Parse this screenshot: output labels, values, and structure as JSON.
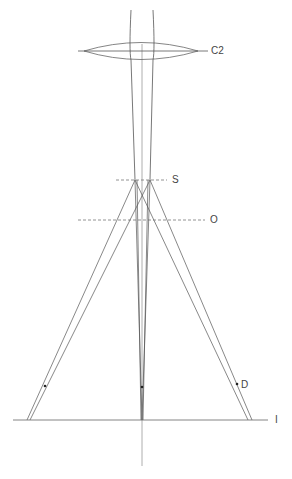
{
  "diagram": {
    "type": "ray-optics",
    "colors": {
      "line": "#555555",
      "axis": "#999999",
      "dash": "#777777",
      "dot": "#222222"
    },
    "labels": {
      "condenser": "C2",
      "specimen": "S",
      "objective_plane": "O",
      "defocus_point": "D",
      "image_plane": "I"
    },
    "elements": [
      {
        "id": "C2",
        "kind": "lens",
        "label": "C2"
      },
      {
        "id": "S",
        "kind": "dashed-plane",
        "label": "S"
      },
      {
        "id": "O",
        "kind": "dashed-plane",
        "label": "O"
      },
      {
        "id": "I",
        "kind": "solid-plane",
        "label": "I"
      },
      {
        "id": "D",
        "kind": "point",
        "label": "D"
      }
    ]
  }
}
